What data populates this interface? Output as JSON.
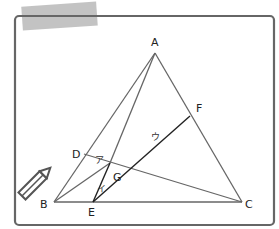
{
  "diagram": {
    "points": {
      "A": {
        "label": "A"
      },
      "B": {
        "label": "B"
      },
      "C": {
        "label": "C"
      },
      "D": {
        "label": "D"
      },
      "E": {
        "label": "E"
      },
      "F": {
        "label": "F"
      },
      "G": {
        "label": "G"
      }
    },
    "segments": [
      "AB",
      "BC",
      "CA",
      "AG",
      "BG",
      "CD",
      "EF"
    ],
    "markers": [
      {
        "label": "ア",
        "on": "DG"
      },
      {
        "label": "イ",
        "on": "EG"
      },
      {
        "label": "ウ",
        "on": "GF"
      }
    ],
    "icons": [
      "pencil-icon",
      "tape-decoration"
    ]
  }
}
